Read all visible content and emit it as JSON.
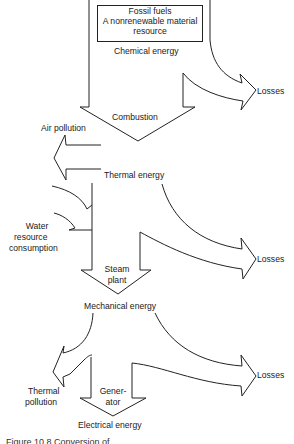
{
  "diagram": {
    "source": {
      "line1": "Fossil fuels",
      "line2": "A nonrenewable material",
      "line3": "resource"
    },
    "stages": {
      "chemical": "Chemical energy",
      "combustion": "Combustion",
      "thermal": "Thermal energy",
      "steam_plant_1": "Steam",
      "steam_plant_2": "plant",
      "mechanical": "Mechanical energy",
      "generator_1": "Gener-",
      "generator_2": "ator",
      "electrical": "Electrical energy"
    },
    "outputs": {
      "losses_1": "Losses",
      "losses_2": "Losses",
      "losses_3": "Losses",
      "air_pollution": "Air pollution",
      "water_1": "Water",
      "water_2": "resource",
      "water_3": "consumption",
      "thermal_pollution_1": "Thermal",
      "thermal_pollution_2": "pollution"
    },
    "caption_partial": "Figure 10.8   Conversion of ..."
  },
  "colors": {
    "stroke": "#222222",
    "text": "#1a1a1a",
    "background": "#ffffff"
  }
}
